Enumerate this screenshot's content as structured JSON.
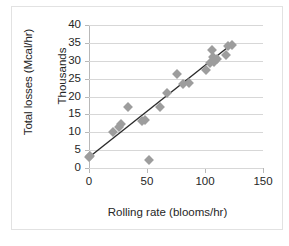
{
  "chart_data": {
    "type": "scatter",
    "title": "",
    "xlabel": "Rolling rate (blooms/hr)",
    "ylabel": "Total losses (Mcal/hr)",
    "y_unit_label": "Thousands",
    "xlim": [
      0,
      150
    ],
    "ylim": [
      0,
      40
    ],
    "xticks": [
      "0",
      "50",
      "100",
      "150"
    ],
    "xtick_values": [
      0,
      50,
      100,
      150
    ],
    "yticks": [
      "0",
      "5",
      "10",
      "15",
      "20",
      "25",
      "30",
      "35",
      "40"
    ],
    "ytick_values": [
      0,
      5,
      10,
      15,
      20,
      25,
      30,
      35,
      40
    ],
    "grid": "horizontal",
    "legend": "none",
    "marker_shape": "diamond",
    "marker_color": "#9d9d9d",
    "trendline_color": "#2b2b2b",
    "series": [
      {
        "name": "Total losses vs rolling rate",
        "points": [
          {
            "x": 0,
            "y": 3.2
          },
          {
            "x": 1,
            "y": 3.4
          },
          {
            "x": 21,
            "y": 10.1
          },
          {
            "x": 26,
            "y": 11.6
          },
          {
            "x": 28,
            "y": 12.4
          },
          {
            "x": 34,
            "y": 17.0
          },
          {
            "x": 46,
            "y": 13.2
          },
          {
            "x": 48,
            "y": 13.4
          },
          {
            "x": 52,
            "y": 2.2
          },
          {
            "x": 61,
            "y": 17.1
          },
          {
            "x": 67,
            "y": 21.1
          },
          {
            "x": 76,
            "y": 26.2
          },
          {
            "x": 81,
            "y": 23.6
          },
          {
            "x": 86,
            "y": 23.7
          },
          {
            "x": 101,
            "y": 27.4
          },
          {
            "x": 104,
            "y": 29.3
          },
          {
            "x": 106,
            "y": 33.1
          },
          {
            "x": 107,
            "y": 31.0
          },
          {
            "x": 108,
            "y": 29.6
          },
          {
            "x": 110,
            "y": 30.4
          },
          {
            "x": 118,
            "y": 31.6
          },
          {
            "x": 120,
            "y": 34.2
          },
          {
            "x": 123,
            "y": 34.5
          }
        ]
      }
    ],
    "trendline": {
      "x1": 0,
      "y1": 3.0,
      "x2": 123,
      "y2": 34.6
    }
  },
  "bottom_fragment": ""
}
